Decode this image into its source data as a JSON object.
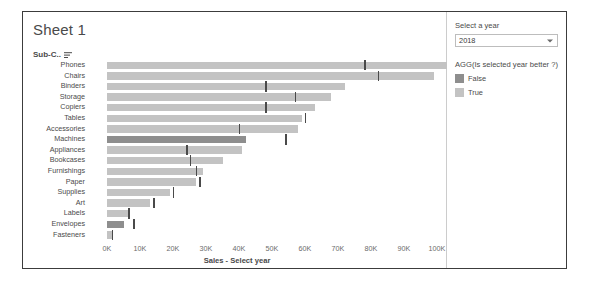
{
  "sheet": {
    "title": "Sheet 1",
    "field_header": "Sub-C..",
    "sort_icon": "sort-descending-icon"
  },
  "controls": {
    "year_label": "Select a year",
    "year_value": "2018",
    "legend_title": "AGG(Is selected year better ?)",
    "legend": [
      {
        "label": "False",
        "color": "#8e8e8e"
      },
      {
        "label": "True",
        "color": "#c3c3c3"
      }
    ]
  },
  "colors": {
    "bar_true": "#c3c3c3",
    "bar_false": "#8e8e8e",
    "marker": "#4a4a4a",
    "border": "#3c3c3c"
  },
  "chart_data": {
    "type": "bar",
    "title": "Sheet 1",
    "xlabel": "Sales - Select year",
    "ylabel": "Sub-C..",
    "orientation": "horizontal",
    "xlim": [
      0,
      115000
    ],
    "xticks": [
      "0K",
      "10K",
      "20K",
      "30K",
      "40K",
      "50K",
      "60K",
      "70K",
      "80K",
      "90K",
      "100K",
      "110K"
    ],
    "xtick_values": [
      0,
      10000,
      20000,
      30000,
      40000,
      50000,
      60000,
      70000,
      80000,
      90000,
      100000,
      110000
    ],
    "grid": false,
    "legend_position": "right",
    "series_field": "AGG(Is selected year better ?)",
    "categories": [
      "Phones",
      "Chairs",
      "Binders",
      "Storage",
      "Copiers",
      "Tables",
      "Accessories",
      "Machines",
      "Appliances",
      "Bookcases",
      "Furnishings",
      "Paper",
      "Supplies",
      "Art",
      "Labels",
      "Envelopes",
      "Fasteners"
    ],
    "values": [
      105000,
      99000,
      72000,
      68000,
      63000,
      59000,
      58000,
      42000,
      41000,
      35000,
      29000,
      27000,
      19000,
      13000,
      7000,
      5000,
      1500
    ],
    "reference_values": [
      78000,
      82000,
      48000,
      57000,
      48000,
      60000,
      40000,
      54000,
      24000,
      25000,
      27000,
      28000,
      20000,
      14000,
      6500,
      8000,
      1500
    ],
    "better": [
      "True",
      "True",
      "True",
      "True",
      "True",
      "True",
      "True",
      "False",
      "True",
      "True",
      "True",
      "True",
      "True",
      "True",
      "True",
      "False",
      "True"
    ],
    "reference_line_label": "Previous year"
  }
}
